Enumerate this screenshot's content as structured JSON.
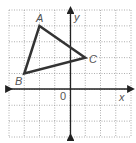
{
  "figure": {
    "type": "coordinate-plane-triangle",
    "grid": {
      "x_min": -4,
      "x_max": 4,
      "y_min": -3,
      "y_max": 5,
      "style": "dotted"
    },
    "axes": {
      "x_label": "x",
      "y_label": "y",
      "origin_label": "0"
    },
    "triangle": {
      "vertices": [
        {
          "label": "A",
          "x": -2,
          "y": 4
        },
        {
          "label": "B",
          "x": -3,
          "y": 1
        },
        {
          "label": "C",
          "x": 1,
          "y": 2
        }
      ],
      "stroke_color": "#333333"
    },
    "colors": {
      "grid": "#999999",
      "axis": "#222222",
      "label": "#555555"
    }
  }
}
